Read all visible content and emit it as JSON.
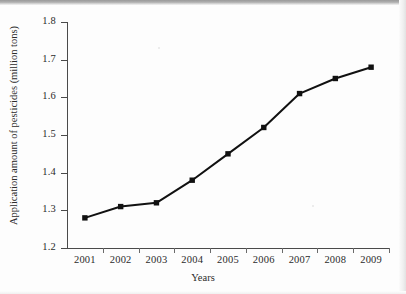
{
  "chart_data": {
    "type": "line",
    "title": "",
    "xlabel": "Years",
    "ylabel": "Application amount of pesticides (million tons)",
    "categories": [
      "2001",
      "2002",
      "2003",
      "2004",
      "2005",
      "2006",
      "2007",
      "2008",
      "2009"
    ],
    "values": [
      1.28,
      1.31,
      1.32,
      1.38,
      1.45,
      1.52,
      1.61,
      1.65,
      1.68
    ],
    "series": [
      {
        "name": "Application amount of pesticides",
        "values": [
          1.28,
          1.31,
          1.32,
          1.38,
          1.45,
          1.52,
          1.61,
          1.65,
          1.68
        ]
      }
    ],
    "ylim": [
      1.2,
      1.8
    ],
    "ytick_labels": [
      "1.8",
      "1.7",
      "1.6",
      "1.5",
      "1.4",
      "1.3",
      "1.2"
    ],
    "ytick_values": [
      1.8,
      1.7,
      1.6,
      1.5,
      1.4,
      1.3,
      1.2
    ],
    "ytick_step": 0.1,
    "grid": false,
    "legend": false,
    "legend_position": "none",
    "marker": "square",
    "marker_color": "#111111",
    "line_color": "#111111",
    "line_width": 2,
    "background_color": "#fdfdfd",
    "axis_color": "#4a4a4a",
    "text_color": "#2b2b2b",
    "annotations": []
  },
  "axes": {
    "y_title": "Application amount of pesticides (million tons)",
    "x_title": "Years"
  }
}
